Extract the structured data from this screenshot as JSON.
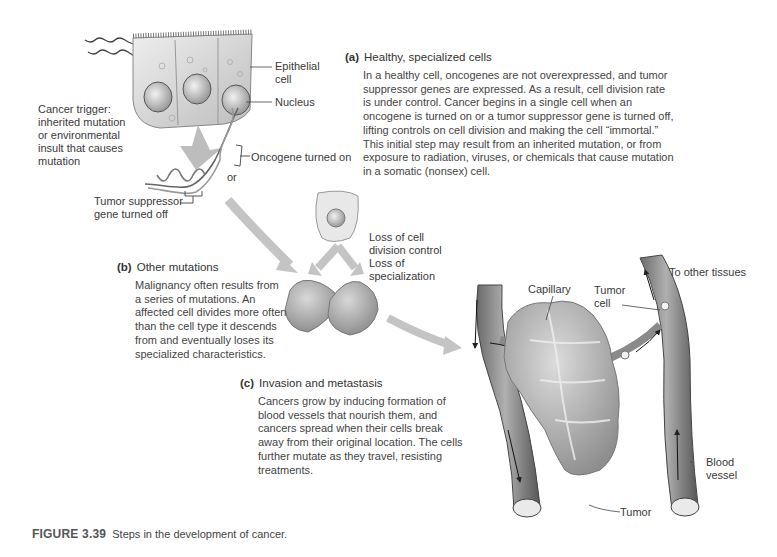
{
  "figure": {
    "number": "FIGURE 3.39",
    "caption": "Steps in the development of cancer."
  },
  "panels": {
    "a": {
      "letter": "(a)",
      "title": "Healthy, specialized cells",
      "body": "In a healthy cell, oncogenes are not overexpressed, and tumor suppressor genes are expressed. As a result, cell division rate is under control. Cancer begins in a single cell when an oncogene is turned on or a tumor suppressor gene is turned off, lifting controls on cell division and making the cell “immortal.” This initial step may result from an inherited mutation, or from exposure to radiation, viruses, or chemicals that cause mutation in a somatic (nonsex) cell."
    },
    "b": {
      "letter": "(b)",
      "title": "Other mutations",
      "body": "Malignancy often results from a series of mutations. An affected cell divides more often than the cell type it descends from and eventually loses its specialized characteristics."
    },
    "c": {
      "letter": "(c)",
      "title": "Invasion and metastasis",
      "body": "Cancers grow by inducing formation of blood vessels that nourish them, and cancers spread when their cells break away from their original location. The cells further mutate as they travel, resisting treatments."
    }
  },
  "labels": {
    "cancer_trigger": "Cancer trigger: inherited mutation or environmental insult that causes mutation",
    "epithelial_cell": "Epithelial cell",
    "nucleus": "Nucleus",
    "oncogene": "Oncogene turned on",
    "or": "or",
    "tumor_suppressor": "Tumor suppressor gene turned off",
    "loss_division": "Loss of cell division control",
    "loss_specialization": "Loss of specialization",
    "capillary": "Capillary",
    "tumor_cell": "Tumor cell",
    "to_other_tissues": "To other tissues",
    "blood_vessel": "Blood vessel",
    "tumor": "Tumor"
  }
}
